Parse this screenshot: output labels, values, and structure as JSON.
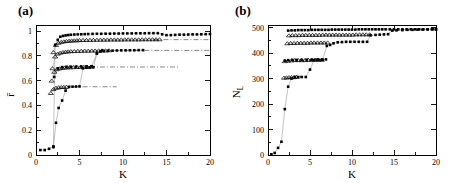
{
  "figure": {
    "panels": [
      {
        "key": "a",
        "label": "(a)"
      },
      {
        "key": "b",
        "label": "(b)"
      }
    ]
  },
  "chart_data": [
    {
      "id": "panel-a",
      "type": "scatter",
      "title": "(a)",
      "xlabel": "K",
      "ylabel": "r̄",
      "xlim": [
        0,
        20
      ],
      "ylim": [
        0,
        1.05
      ],
      "xticks": [
        0,
        5,
        10,
        15,
        20
      ],
      "xticklabels": [
        "0",
        "5",
        "10",
        "15",
        "20"
      ],
      "yticks": [
        0,
        0.2,
        0.4,
        0.6,
        0.8,
        1
      ],
      "yticklabels": [
        "0",
        "0.2",
        "0.4",
        "0.6",
        "0.8",
        "1"
      ],
      "grid": false,
      "legend": "none",
      "series": [
        {
          "name": "curve-1-filled-top",
          "marker": "filled-square",
          "x": [
            0.5,
            1.0,
            1.5,
            2.0,
            2.2,
            2.5,
            2.8,
            3.1,
            3.4,
            3.7,
            4.0,
            4.4,
            4.8,
            5.2,
            5.6,
            6.0,
            6.5,
            7.0,
            7.5,
            8.0,
            8.5,
            9.0,
            9.5,
            10.0,
            10.5,
            11.0,
            11.5,
            12.0,
            12.5,
            13.0,
            13.5,
            14.0,
            14.5,
            15.0,
            15.5,
            16.0,
            16.5,
            17.0,
            17.5,
            18.0,
            18.5,
            19.0,
            19.5,
            20.0
          ],
          "y": [
            0.04,
            0.04,
            0.05,
            0.07,
            0.89,
            0.93,
            0.955,
            0.962,
            0.966,
            0.969,
            0.971,
            0.973,
            0.974,
            0.975,
            0.976,
            0.977,
            0.978,
            0.979,
            0.979,
            0.98,
            0.98,
            0.981,
            0.981,
            0.982,
            0.982,
            0.982,
            0.983,
            0.983,
            0.983,
            0.984,
            0.984,
            0.984,
            0.975,
            0.968,
            0.968,
            0.97,
            0.972,
            0.972,
            0.973,
            0.974,
            0.974,
            0.975,
            0.976,
            0.977
          ]
        },
        {
          "name": "curve-2-triangles-0.93",
          "marker": "open-triangle",
          "x": [
            2.0,
            2.3,
            2.6,
            2.9,
            3.2,
            3.5,
            3.8,
            4.1,
            4.4,
            4.7,
            5.0,
            5.4,
            5.8,
            6.2,
            6.6,
            7.0,
            7.4,
            7.8,
            8.2,
            8.6,
            9.0,
            9.4,
            9.8,
            10.2,
            10.6,
            11.0,
            11.4,
            11.8,
            12.2,
            12.6,
            13.0,
            13.4,
            13.8,
            14.2
          ],
          "y": [
            0.83,
            0.888,
            0.906,
            0.913,
            0.917,
            0.92,
            0.922,
            0.924,
            0.925,
            0.926,
            0.927,
            0.928,
            0.929,
            0.929,
            0.93,
            0.93,
            0.931,
            0.931,
            0.931,
            0.932,
            0.932,
            0.932,
            0.932,
            0.933,
            0.933,
            0.933,
            0.933,
            0.933,
            0.934,
            0.934,
            0.934,
            0.934,
            0.934,
            0.934
          ]
        },
        {
          "name": "curve-3-triangles-0.84",
          "marker": "open-triangle",
          "x": [
            1.9,
            2.2,
            2.5,
            2.8,
            3.1,
            3.4,
            3.7,
            4.0,
            4.4,
            4.8,
            5.2,
            5.6,
            6.0,
            6.4,
            6.8,
            7.2,
            7.6,
            8.0,
            8.4
          ],
          "y": [
            0.7,
            0.795,
            0.818,
            0.826,
            0.831,
            0.834,
            0.836,
            0.838,
            0.839,
            0.84,
            0.841,
            0.842,
            0.842,
            0.843,
            0.843,
            0.844,
            0.844,
            0.844,
            0.845
          ]
        },
        {
          "name": "curve-4-triangles-0.71",
          "marker": "open-triangle",
          "x": [
            1.8,
            2.1,
            2.4,
            2.7,
            3.0,
            3.3,
            3.6,
            3.9,
            4.3,
            4.7,
            5.1,
            5.5,
            5.9,
            6.3
          ],
          "y": [
            0.6,
            0.672,
            0.692,
            0.699,
            0.703,
            0.706,
            0.707,
            0.708,
            0.709,
            0.71,
            0.71,
            0.711,
            0.711,
            0.712
          ]
        },
        {
          "name": "curve-5-triangles-0.55",
          "marker": "open-triangle",
          "x": [
            1.7,
            2.0,
            2.3,
            2.6,
            2.9,
            3.2,
            3.5
          ],
          "y": [
            0.5,
            0.532,
            0.542,
            0.546,
            0.548,
            0.549,
            0.55
          ]
        },
        {
          "name": "curve-6-filled-steps",
          "marker": "filled-square",
          "x": [
            2.0,
            2.3,
            2.6,
            3.0,
            3.4,
            3.8,
            4.2,
            4.6,
            5.0,
            5.4,
            5.8,
            6.2,
            6.6,
            7.0,
            7.4,
            7.8,
            8.3,
            8.8,
            9.3,
            9.8,
            10.3,
            10.8,
            11.3,
            11.8,
            12.3
          ],
          "y": [
            0.063,
            0.26,
            0.38,
            0.44,
            0.52,
            0.551,
            0.552,
            0.553,
            0.554,
            0.7,
            0.706,
            0.708,
            0.709,
            0.82,
            0.836,
            0.84,
            0.842,
            0.843,
            0.844,
            0.845,
            0.845,
            0.846,
            0.846,
            0.847,
            0.847
          ]
        },
        {
          "name": "curve-7-filled-upper-steps",
          "marker": "filled-square",
          "x": [
            2.1,
            2.5,
            3.0,
            3.5,
            4.0,
            4.6,
            5.2,
            5.8,
            6.4,
            7.0,
            7.6
          ],
          "y": [
            0.63,
            0.7,
            0.71,
            0.712,
            0.713,
            0.714,
            0.715,
            0.716,
            0.717,
            0.82,
            0.845
          ]
        }
      ],
      "reference_lines": [
        {
          "name": "dashdot-0.93",
          "y": 0.932,
          "x_start": 13.5,
          "x_end": 20.0
        },
        {
          "name": "dashdot-0.84",
          "y": 0.845,
          "x_start": 9.0,
          "x_end": 20.0
        },
        {
          "name": "dashdot-0.71",
          "y": 0.711,
          "x_start": 6.2,
          "x_end": 16.5
        },
        {
          "name": "dashdot-0.55",
          "y": 0.551,
          "x_start": 4.2,
          "x_end": 9.3
        }
      ]
    },
    {
      "id": "panel-b",
      "type": "scatter",
      "title": "(b)",
      "xlabel": "K",
      "ylabel": "N_L",
      "xlim": [
        0,
        20
      ],
      "ylim": [
        0,
        510
      ],
      "xticks": [
        0,
        5,
        10,
        15,
        20
      ],
      "xticklabels": [
        "0",
        "5",
        "10",
        "15",
        "20"
      ],
      "yticks": [
        0,
        100,
        200,
        300,
        400,
        500
      ],
      "yticklabels": [
        "0",
        "100",
        "200",
        "300",
        "400",
        "500"
      ],
      "grid": false,
      "legend": "none",
      "series": [
        {
          "name": "curve-1-filled-top-490",
          "marker": "filled-square",
          "x": [
            2.4,
            2.8,
            3.2,
            3.6,
            4.0,
            4.4,
            4.8,
            5.2,
            5.6,
            6.0,
            6.4,
            6.8,
            7.2,
            7.6,
            8.0,
            8.4,
            8.8,
            9.2,
            9.6,
            10.0,
            10.4,
            10.8,
            11.2,
            11.6,
            12.0,
            12.4,
            12.8,
            13.2,
            13.6,
            14.0,
            14.5,
            15.0,
            15.5,
            16.0,
            16.5,
            17.0,
            17.5,
            18.0,
            18.5,
            19.0,
            19.5,
            20.0
          ],
          "y": [
            488,
            489,
            489,
            490,
            490,
            490,
            490,
            491,
            491,
            491,
            491,
            491,
            491,
            492,
            492,
            492,
            492,
            492,
            492,
            492,
            492,
            493,
            493,
            493,
            493,
            493,
            493,
            493,
            493,
            493,
            493,
            493,
            493,
            493,
            493,
            493,
            493,
            493,
            493,
            493,
            493,
            493
          ]
        },
        {
          "name": "curve-2-triangles-470",
          "marker": "open-triangle",
          "x": [
            2.5,
            2.9,
            3.3,
            3.7,
            4.1,
            4.5,
            4.9,
            5.3,
            5.7,
            6.1,
            6.5,
            6.9,
            7.3,
            7.7,
            8.1,
            8.5,
            8.9,
            9.3,
            9.7,
            10.1,
            10.5,
            10.9,
            11.3,
            11.7,
            12.1
          ],
          "y": [
            469,
            470,
            470,
            470,
            471,
            471,
            471,
            471,
            471,
            471,
            472,
            472,
            472,
            472,
            472,
            472,
            472,
            472,
            472,
            472,
            473,
            473,
            473,
            473,
            473
          ]
        },
        {
          "name": "curve-3-triangles-440",
          "marker": "open-triangle",
          "x": [
            2.3,
            2.7,
            3.1,
            3.5,
            3.9,
            4.3,
            4.7,
            5.1,
            5.5,
            5.9,
            6.3,
            6.7,
            7.1
          ],
          "y": [
            438,
            439,
            439,
            440,
            440,
            440,
            440,
            441,
            441,
            441,
            441,
            441,
            441
          ]
        },
        {
          "name": "curve-4-triangles-370",
          "marker": "open-triangle",
          "x": [
            2.0,
            2.4,
            2.8,
            3.2,
            3.6,
            4.0,
            4.4,
            4.8,
            5.2,
            5.6,
            6.0,
            6.4
          ],
          "y": [
            368,
            370,
            371,
            372,
            372,
            372,
            372,
            373,
            373,
            373,
            373,
            373
          ]
        },
        {
          "name": "curve-5-triangles-305",
          "marker": "open-triangle",
          "x": [
            1.9,
            2.2,
            2.5,
            2.8,
            3.1,
            3.4
          ],
          "y": [
            303,
            304,
            305,
            305,
            305,
            306
          ]
        },
        {
          "name": "curve-6-filled-staircase",
          "marker": "filled-square",
          "x": [
            0.4,
            0.8,
            1.2,
            1.6,
            2.0,
            2.4,
            2.8,
            3.2,
            3.6,
            4.0,
            4.5,
            5.0,
            5.5,
            6.0,
            6.5,
            7.0,
            7.4,
            7.8,
            8.3,
            8.8,
            9.3,
            9.8,
            10.3,
            10.8,
            11.3,
            11.8,
            12.2,
            12.8,
            13.3,
            13.8,
            14.3,
            14.8,
            15.3,
            16.0,
            16.6,
            17.2,
            17.8,
            18.4,
            19.0,
            19.6,
            20.0
          ],
          "y": [
            3,
            8,
            28,
            52,
            180,
            268,
            300,
            306,
            306,
            306,
            306,
            335,
            373,
            374,
            374,
            428,
            432,
            438,
            442,
            443,
            444,
            444,
            444,
            444,
            444,
            444,
            470,
            471,
            472,
            473,
            474,
            488,
            489,
            490,
            491,
            491,
            492,
            492,
            493,
            493,
            493
          ]
        },
        {
          "name": "curve-7-filled-mid",
          "marker": "filled-square",
          "x": [
            2.0,
            2.4,
            2.9,
            3.4,
            4.0,
            4.6,
            5.2,
            5.8,
            6.4,
            6.9
          ],
          "y": [
            370,
            372,
            373,
            373,
            373,
            374,
            374,
            374,
            374,
            375
          ]
        }
      ]
    }
  ]
}
